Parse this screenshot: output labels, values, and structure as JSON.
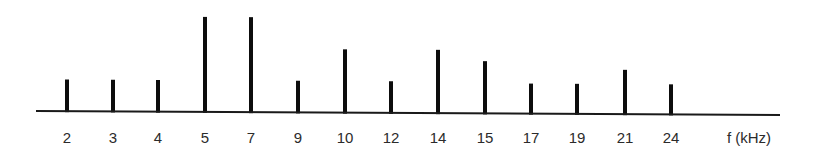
{
  "chart_data": {
    "type": "bar",
    "subtype": "line-spectrum",
    "title": "",
    "xlabel": "f (kHz)",
    "ylabel": "",
    "categories": [
      "2",
      "3",
      "4",
      "5",
      "7",
      "9",
      "10",
      "12",
      "14",
      "15",
      "17",
      "19",
      "21",
      "24"
    ],
    "x": [
      2,
      3,
      4,
      5,
      7,
      9,
      10,
      12,
      14,
      15,
      17,
      19,
      21,
      24
    ],
    "values": [
      1.0,
      1.0,
      1.0,
      3.0,
      3.0,
      1.0,
      2.0,
      1.0,
      2.0,
      1.65,
      0.95,
      0.95,
      1.4,
      0.95
    ],
    "value_units": "relative amplitude (unlabeled)",
    "ylim": [
      0,
      3
    ],
    "grid": false,
    "legend": null,
    "y_axis_shown": false
  },
  "layout": {
    "axis_start_x": 36,
    "axis_end_x": 780,
    "baseline_y_left": 111,
    "baseline_y_right": 115,
    "tallest_bar_top_y": 16,
    "bar_x": [
      67,
      113,
      158,
      205,
      251,
      298,
      345,
      391,
      438,
      485,
      531,
      577,
      625,
      671
    ],
    "label_y": 143,
    "xlabel_x": 749
  },
  "colors": {
    "bars": "#0d0d0d",
    "axis": "#1a1a1a",
    "text": "#2b2b2b",
    "background": "#ffffff"
  }
}
